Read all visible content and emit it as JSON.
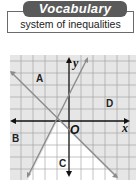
{
  "header": {
    "tab_label": "Vocabulary",
    "term": "system of inequalities"
  },
  "graph": {
    "region_labels": [
      "A",
      "B",
      "C",
      "D"
    ],
    "axis_x_label": "x",
    "axis_y_label": "y",
    "origin_label": "O",
    "colors": {
      "shaded": "#e3e3e3",
      "grid": "#8a8a8a",
      "axis": "#111111",
      "line": "#8c8c8c"
    }
  }
}
